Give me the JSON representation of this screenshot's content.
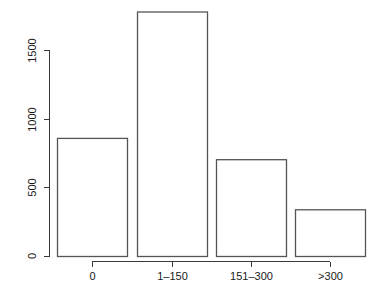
{
  "chart_data": {
    "type": "bar",
    "title": "",
    "subtitle": "",
    "xlabel": "",
    "ylabel": "",
    "categories": [
      "0",
      "1–150",
      "151–300",
      ">300"
    ],
    "values": [
      860,
      1780,
      705,
      340
    ],
    "series": [
      {
        "name": "Frequency",
        "values": [
          860,
          1780,
          705,
          340
        ]
      }
    ],
    "ylim": [
      0,
      1800
    ],
    "xlim": [
      0,
      4
    ],
    "y_ticks": [
      0,
      500,
      1000,
      1500
    ],
    "y_tick_labels": [
      "0",
      "500",
      "1000",
      "1500"
    ],
    "x_tick_labels": [
      "0",
      "1–150",
      "151–300",
      ">300"
    ],
    "grid": false,
    "legend": null,
    "legend_position": "none",
    "annotations": [],
    "style": {
      "bar_fill": "#ffffff",
      "bar_border": "#555555",
      "axis_color": "#3a3a3a",
      "text_color": "#1a1a1a",
      "background": "#ffffff",
      "y_axis_label_rotation": -90
    }
  }
}
